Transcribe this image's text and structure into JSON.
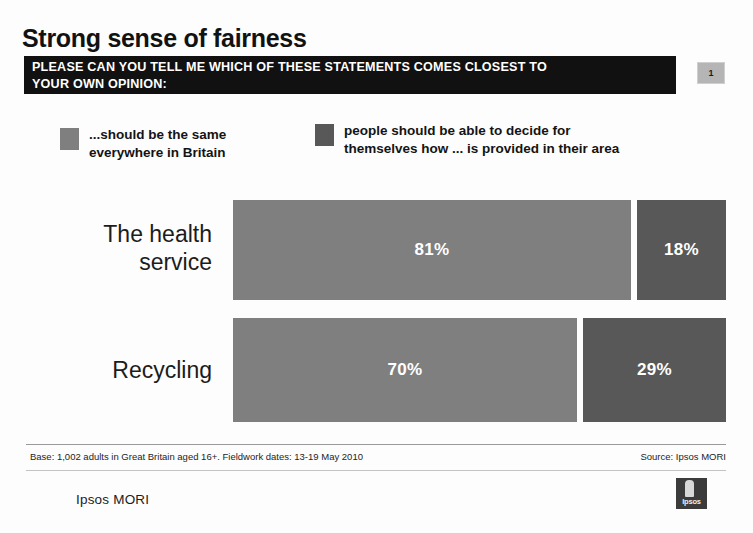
{
  "slide": {
    "title": "Strong sense of fairness",
    "page_number": "1",
    "question": {
      "line1": "PLEASE CAN YOU TELL ME WHICH OF THESE STATEMENTS COMES CLOSEST TO",
      "line2": "YOUR OWN OPINION:"
    }
  },
  "legend": {
    "items": [
      {
        "line1": "...should be the same",
        "line2": "everywhere in Britain",
        "color": "#7f7f7f"
      },
      {
        "line1": "people should be able to decide for",
        "line2": "themselves how ... is provided in their area",
        "color": "#585858"
      }
    ]
  },
  "chart_data": {
    "type": "bar",
    "orientation": "horizontal",
    "stacked": true,
    "title": "Strong sense of fairness",
    "xlabel": "",
    "ylabel": "",
    "xlim": [
      0,
      100
    ],
    "grid": false,
    "legend_position": "top",
    "categories": [
      "The health service",
      "Recycling"
    ],
    "series": [
      {
        "name": "...should be the same everywhere in Britain",
        "color": "#7f7f7f",
        "values": [
          81,
          70
        ],
        "labels": [
          "81%",
          "70%"
        ]
      },
      {
        "name": "people should be able to decide for themselves how ... is provided in their area",
        "color": "#585858",
        "values": [
          18,
          29
        ],
        "labels": [
          "18%",
          "29%"
        ]
      }
    ],
    "rows": [
      {
        "label_line1": "The health",
        "label_line2": "service",
        "light": {
          "value": 81,
          "label": "81%"
        },
        "dark": {
          "value": 18,
          "label": "18%"
        }
      },
      {
        "label_line1": "Recycling",
        "label_line2": "",
        "light": {
          "value": 70,
          "label": "70%"
        },
        "dark": {
          "value": 29,
          "label": "29%"
        }
      }
    ]
  },
  "footer": {
    "base": "Base: 1,002 adults in Great Britain aged 16+. Fieldwork dates: 13-19 May 2010",
    "source": "Source: Ipsos MORI",
    "brand": "Ipsos MORI",
    "logo_text": "Ipsos"
  }
}
